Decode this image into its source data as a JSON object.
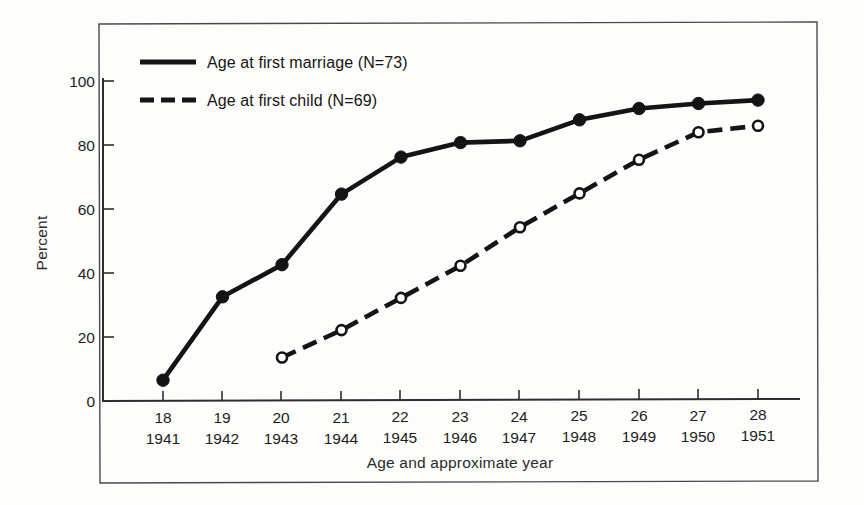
{
  "chart_data": {
    "type": "line",
    "title": "",
    "xlabel": "Age and approximate year",
    "ylabel": "Percent",
    "ylim": [
      0,
      110
    ],
    "yticks": [
      0,
      20,
      40,
      60,
      80,
      100
    ],
    "grid": false,
    "legend_position": "top-left-inside",
    "x": [
      18,
      19,
      20,
      21,
      22,
      23,
      24,
      25,
      26,
      27,
      28
    ],
    "categories": [
      "18",
      "19",
      "20",
      "21",
      "22",
      "23",
      "24",
      "25",
      "26",
      "27",
      "28"
    ],
    "secondary_categories": [
      "1941",
      "1942",
      "1943",
      "1944",
      "1945",
      "1946",
      "1947",
      "1948",
      "1949",
      "1950",
      "1951"
    ],
    "series": [
      {
        "name": "Age at first marriage (N=73)",
        "style": "solid",
        "marker": "filled-circle",
        "color": "#141414",
        "values": [
          6.5,
          32.5,
          42.5,
          64.5,
          76.0,
          80.5,
          81.0,
          87.5,
          91.0,
          92.5,
          93.5
        ]
      },
      {
        "name": "Age at first child (N=69)",
        "style": "dashed",
        "marker": "open-circle",
        "color": "#141414",
        "values": [
          null,
          null,
          13.5,
          22.0,
          32.0,
          42.0,
          54.0,
          64.5,
          75.0,
          83.5,
          85.5
        ]
      }
    ]
  },
  "legend": {
    "entries": [
      {
        "label": "Age at first marriage (N=73)",
        "style": "solid"
      },
      {
        "label": "Age at first child (N=69)",
        "style": "dashed"
      }
    ]
  },
  "axes": {
    "y_axis_label": "Percent",
    "x_axis_label": "Age and approximate year",
    "y_tick_labels": [
      "0",
      "20",
      "40",
      "60",
      "80",
      "100"
    ],
    "x_tick_ages": [
      "18",
      "19",
      "20",
      "21",
      "22",
      "23",
      "24",
      "25",
      "26",
      "27",
      "28"
    ],
    "x_tick_years": [
      "1941",
      "1942",
      "1943",
      "1944",
      "1945",
      "1946",
      "1947",
      "1948",
      "1949",
      "1950",
      "1951"
    ]
  },
  "colors": {
    "ink": "#141414",
    "frame": "#3a3a3a",
    "background": "#fdfdfb"
  }
}
